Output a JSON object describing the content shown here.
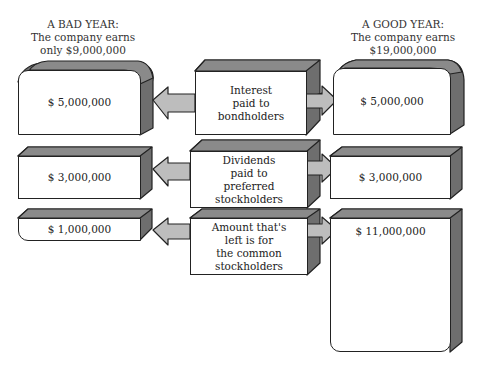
{
  "headers": {
    "bad_year": [
      "A BAD YEAR:",
      "The company earns",
      "only $9,000,000"
    ],
    "good_year": [
      "A GOOD YEAR:",
      "The company earns",
      "$19,000,000"
    ]
  },
  "rows": [
    {
      "middle": [
        "Interest",
        "paid to",
        "bondholders"
      ],
      "bad_amount": "$  5,000,000",
      "good_amount": "$  5,000,000"
    },
    {
      "middle": [
        "Dividends",
        "paid to",
        "preferred",
        "stockholders"
      ],
      "bad_amount": "$  3,000,000",
      "good_amount": "$  3,000,000"
    },
    {
      "middle": [
        "Amount that's",
        "left is for",
        "the common",
        "stockholders"
      ],
      "bad_amount": "$  1,000,000",
      "good_amount": "$  11,000,000"
    }
  ],
  "colors": {
    "top_face": "#8a8a8a",
    "side_face": "#6e6e6e",
    "arrow": "#bdbdbd",
    "outline": "#222222"
  }
}
